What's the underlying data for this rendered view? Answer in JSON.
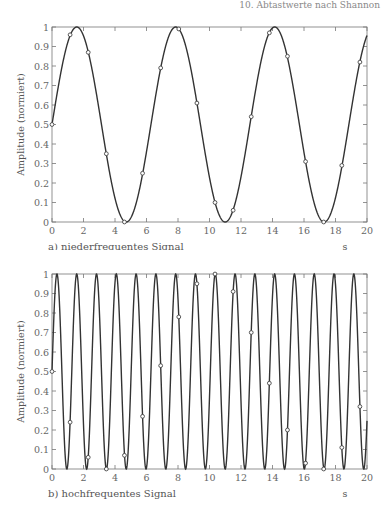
{
  "header": {
    "text": "10. Abtastwerte nach Shannon"
  },
  "chart_data": [
    {
      "type": "line",
      "id": "a",
      "title": "",
      "caption": "a) niederfrequentes Signal",
      "xlabel": "s",
      "ylabel": "Amplitude (normiert)",
      "xlim": [
        0,
        20
      ],
      "ylim": [
        0,
        1
      ],
      "xticks": [
        0,
        2,
        4,
        6,
        8,
        10,
        12,
        14,
        16,
        18,
        20
      ],
      "yticks": [
        0,
        0.1,
        0.2,
        0.3,
        0.4,
        0.5,
        0.6,
        0.7,
        0.8,
        0.9,
        1
      ],
      "ytick_labels": [
        "0",
        "0.1",
        "0.2",
        "0.3",
        "0.4",
        "0.5",
        "0.6",
        "0.7",
        "0.8",
        "0.9",
        "1"
      ],
      "grid": false,
      "series": [
        {
          "name": "signal",
          "style": "line",
          "formula": "0.5+0.5*sin(1.0*t)",
          "omega": 1.0
        },
        {
          "name": "samples",
          "style": "markers",
          "x": [
            0,
            1.15,
            2.3,
            3.45,
            4.6,
            5.75,
            6.9,
            8.05,
            9.2,
            10.35,
            11.5,
            12.65,
            13.8,
            14.95,
            16.1,
            17.25,
            18.4,
            19.55
          ],
          "y": [
            0.5,
            0.96,
            0.87,
            0.35,
            0.0,
            0.25,
            0.79,
            0.99,
            0.61,
            0.1,
            0.06,
            0.54,
            0.97,
            0.85,
            0.31,
            0.0,
            0.29,
            0.82
          ]
        }
      ]
    },
    {
      "type": "line",
      "id": "b",
      "title": "",
      "caption": "b) hochfrequentes Signal",
      "xlabel": "s",
      "ylabel": "Amplitude (normiert)",
      "xlim": [
        0,
        20
      ],
      "ylim": [
        0,
        1
      ],
      "xticks": [
        0,
        2,
        4,
        6,
        8,
        10,
        12,
        14,
        16,
        18,
        20
      ],
      "yticks": [
        0,
        0.1,
        0.2,
        0.3,
        0.4,
        0.5,
        0.6,
        0.7,
        0.8,
        0.9,
        1
      ],
      "ytick_labels": [
        "0",
        "0.1",
        "0.2",
        "0.3",
        "0.4",
        "0.5",
        "0.6",
        "0.7",
        "0.8",
        "0.9",
        "1"
      ],
      "grid": false,
      "series": [
        {
          "name": "signal",
          "style": "line",
          "formula": "0.5+0.5*sin(5.0*t)",
          "omega": 5.0
        },
        {
          "name": "samples",
          "style": "markers",
          "x": [
            0,
            1.15,
            2.3,
            3.45,
            4.6,
            5.75,
            6.9,
            8.05,
            9.2,
            10.35,
            11.5,
            12.65,
            13.8,
            14.95,
            16.1,
            17.25,
            18.4,
            19.55
          ],
          "y": [
            0.5,
            0.24,
            0.06,
            0.0,
            0.07,
            0.27,
            0.53,
            0.78,
            0.95,
            1.0,
            0.91,
            0.7,
            0.44,
            0.2,
            0.03,
            0.0,
            0.11,
            0.32
          ]
        }
      ]
    }
  ]
}
